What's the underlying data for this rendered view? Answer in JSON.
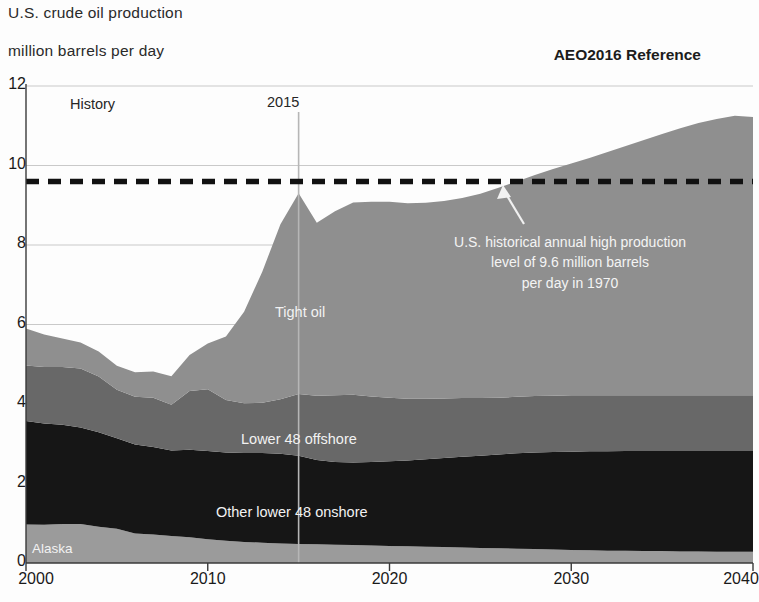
{
  "header": {
    "title_line1": "U.S. crude oil production",
    "title_line2": "million barrels per day",
    "scenario": "AEO2016 Reference"
  },
  "plot_annotations": {
    "history_label": "History",
    "projection_year_label": "2015",
    "callout_line1": "U.S. historical annual high production",
    "callout_line2": "level of 9.6 million barrels",
    "callout_line3": "per day in 1970"
  },
  "colors": {
    "tight_oil": "#8f8f8f",
    "lower48_offshore": "#686868",
    "other_lower48_onshore": "#161616",
    "alaska": "#9b9b9b",
    "gridline": "#c9c9c9",
    "axis": "#3a3a3a",
    "reference_line": "#111111",
    "background": "#fdfdfd"
  },
  "chart_data": {
    "type": "area",
    "title": "U.S. crude oil production",
    "subtitle": "million barrels per day",
    "xlabel": "",
    "ylabel": "million barrels per day",
    "xlim": [
      2000,
      2040
    ],
    "ylim": [
      0,
      12
    ],
    "xticks": [
      2000,
      2010,
      2020,
      2030,
      2040
    ],
    "yticks": [
      0,
      2,
      4,
      6,
      8,
      10,
      12
    ],
    "grid": true,
    "stacked": true,
    "legend": "in-plot labels",
    "history_projection_split_year": 2015,
    "x": [
      2000,
      2001,
      2002,
      2003,
      2004,
      2005,
      2006,
      2007,
      2008,
      2009,
      2010,
      2011,
      2012,
      2013,
      2014,
      2015,
      2016,
      2017,
      2018,
      2019,
      2020,
      2021,
      2022,
      2023,
      2024,
      2025,
      2026,
      2027,
      2028,
      2029,
      2030,
      2031,
      2032,
      2033,
      2034,
      2035,
      2036,
      2037,
      2038,
      2039,
      2040
    ],
    "series": [
      {
        "name": "Alaska",
        "color": "#9b9b9b",
        "values": [
          0.97,
          0.96,
          0.98,
          0.98,
          0.91,
          0.86,
          0.74,
          0.72,
          0.68,
          0.65,
          0.6,
          0.56,
          0.53,
          0.51,
          0.49,
          0.48,
          0.47,
          0.46,
          0.45,
          0.44,
          0.43,
          0.42,
          0.41,
          0.4,
          0.39,
          0.38,
          0.37,
          0.36,
          0.35,
          0.34,
          0.33,
          0.32,
          0.31,
          0.31,
          0.3,
          0.3,
          0.29,
          0.29,
          0.28,
          0.28,
          0.28
        ]
      },
      {
        "name": "Other lower 48 onshore",
        "color": "#161616",
        "values": [
          2.6,
          2.55,
          2.5,
          2.43,
          2.38,
          2.28,
          2.24,
          2.2,
          2.15,
          2.2,
          2.22,
          2.22,
          2.24,
          2.26,
          2.26,
          2.22,
          2.12,
          2.08,
          2.08,
          2.1,
          2.13,
          2.16,
          2.2,
          2.24,
          2.28,
          2.32,
          2.36,
          2.4,
          2.43,
          2.45,
          2.47,
          2.49,
          2.5,
          2.51,
          2.52,
          2.52,
          2.53,
          2.53,
          2.54,
          2.54,
          2.54
        ]
      },
      {
        "name": "Lower 48 offshore",
        "color": "#686868",
        "values": [
          1.4,
          1.42,
          1.45,
          1.48,
          1.4,
          1.22,
          1.2,
          1.24,
          1.15,
          1.48,
          1.55,
          1.32,
          1.25,
          1.26,
          1.37,
          1.55,
          1.62,
          1.68,
          1.7,
          1.65,
          1.6,
          1.55,
          1.52,
          1.5,
          1.48,
          1.45,
          1.43,
          1.42,
          1.42,
          1.42,
          1.42,
          1.41,
          1.41,
          1.4,
          1.4,
          1.4,
          1.4,
          1.4,
          1.4,
          1.4,
          1.4
        ]
      },
      {
        "name": "Tight oil",
        "color": "#8f8f8f",
        "values": [
          0.93,
          0.82,
          0.72,
          0.66,
          0.63,
          0.6,
          0.62,
          0.66,
          0.72,
          0.9,
          1.15,
          1.6,
          2.3,
          3.3,
          4.4,
          5.05,
          4.35,
          4.63,
          4.84,
          4.9,
          4.93,
          4.92,
          4.93,
          4.97,
          5.03,
          5.14,
          5.28,
          5.42,
          5.56,
          5.7,
          5.83,
          5.97,
          6.12,
          6.27,
          6.42,
          6.57,
          6.72,
          6.85,
          6.95,
          7.03,
          7.0
        ]
      }
    ],
    "totals": [
      5.9,
      5.75,
      5.65,
      5.55,
      5.32,
      4.96,
      4.8,
      4.82,
      4.7,
      5.23,
      5.52,
      5.7,
      6.32,
      7.33,
      8.52,
      9.3,
      8.56,
      8.85,
      9.07,
      9.09,
      9.09,
      9.05,
      9.06,
      9.11,
      9.18,
      9.29,
      9.44,
      9.6,
      9.76,
      9.91,
      10.05,
      10.19,
      10.34,
      10.49,
      10.64,
      10.79,
      10.94,
      11.07,
      11.17,
      11.25,
      11.22
    ],
    "reference_line": {
      "label": "U.S. historical annual high production level of 9.6 million barrels per day in 1970",
      "value": 9.6,
      "style": "dashed",
      "color": "#111111"
    },
    "vertical_marker": {
      "label": "2015",
      "value": 2015
    }
  }
}
